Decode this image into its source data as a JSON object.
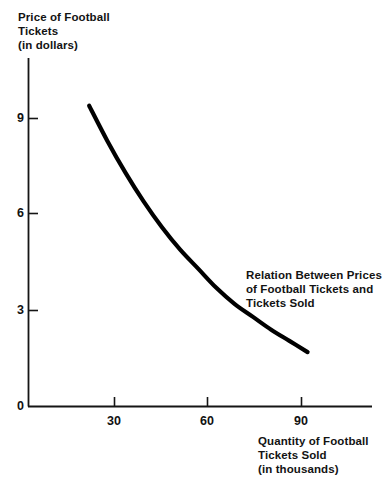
{
  "chart_data": {
    "type": "line",
    "title": "",
    "annotation": "Relation Between Prices\nof Football Tickets and\nTickets Sold",
    "annotation_lines": [
      "Relation Between Prices",
      "of Football Tickets and",
      "Tickets Sold"
    ],
    "ylabel": "Price of Football\nTickets\n(in dollars)",
    "ylabel_lines": [
      "Price of Football",
      "Tickets",
      "(in dollars)"
    ],
    "xlabel": "Quantity of Football\nTickets Sold\n(in thousands)",
    "xlabel_lines": [
      "Quantity of Football",
      "Tickets Sold",
      "(in thousands)"
    ],
    "xlim": [
      0,
      111
    ],
    "ylim": [
      0,
      11.2
    ],
    "xticks": [
      0,
      30,
      60,
      90
    ],
    "xtick_labels": [
      "0",
      "30",
      "60",
      "90"
    ],
    "yticks": [
      0,
      3,
      6,
      9
    ],
    "ytick_labels": [
      "0",
      "3",
      "6",
      "9"
    ],
    "grid": false,
    "legend": false,
    "series": [
      {
        "name": "Demand for Football Tickets",
        "color": "#000000",
        "linewidth": 4.2,
        "x": [
          20,
          26,
          32,
          38,
          44,
          50,
          56,
          62,
          68,
          74,
          80,
          86,
          92
        ],
        "y": [
          9.4,
          8.3,
          7.3,
          6.4,
          5.6,
          4.9,
          4.3,
          3.7,
          3.2,
          2.8,
          2.4,
          2.05,
          1.7
        ]
      }
    ]
  },
  "axis": {
    "origin_label": "0",
    "y_ticks": [
      "9",
      "6",
      "3",
      "0"
    ],
    "x_ticks": [
      "30",
      "60",
      "90"
    ]
  }
}
